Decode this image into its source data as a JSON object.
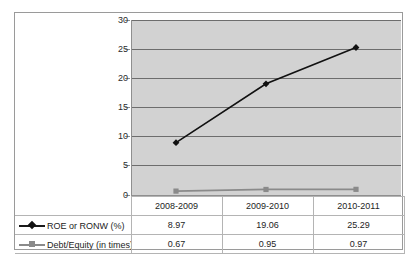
{
  "chart_data": {
    "type": "line",
    "title": "",
    "xlabel": "",
    "ylabel": "",
    "categories": [
      "2008-2009",
      "2009-2010",
      "2010-2011"
    ],
    "ylim": [
      0,
      30
    ],
    "yticks": [
      0,
      5,
      10,
      15,
      20,
      25,
      30
    ],
    "ytick_labels": [
      "0",
      "5",
      "10",
      "15",
      "20",
      "25",
      "30"
    ],
    "grid": true,
    "legend_position": "bottom-table",
    "plot_background": "#d2d2d2",
    "series": [
      {
        "name": "ROE or RONW (%)",
        "marker": "diamond",
        "color": "#111111",
        "values": [
          8.97,
          19.06,
          25.29
        ],
        "value_labels": [
          "8.97",
          "19.06",
          "25.29"
        ]
      },
      {
        "name": "Debt/Equity (in times)",
        "marker": "square",
        "color": "#8a8a8a",
        "values": [
          0.67,
          0.95,
          0.97
        ],
        "value_labels": [
          "0.67",
          "0.95",
          "0.97"
        ]
      }
    ]
  },
  "table": {
    "corner_blank": "",
    "header": [
      "2008-2009",
      "2009-2010",
      "2010-2011"
    ],
    "rows": [
      {
        "label": "ROE or RONW (%)",
        "key": "roe-diamond-icon",
        "cells": [
          "8.97",
          "19.06",
          "25.29"
        ]
      },
      {
        "label": "Debt/Equity (in times)",
        "key": "debt-equity-square-icon",
        "cells": [
          "0.67",
          "0.95",
          "0.97"
        ]
      }
    ]
  },
  "axis": {
    "y_labels": [
      "30",
      "25",
      "20",
      "15",
      "10",
      "5",
      "0"
    ]
  },
  "colors": {
    "plot_bg": "#d2d2d2",
    "gridline": "#6d6d6d",
    "frame": "#9a9a9a",
    "series_roe": "#111111",
    "series_debt_equity": "#8a8a8a",
    "table_border": "#b4b4b4"
  }
}
